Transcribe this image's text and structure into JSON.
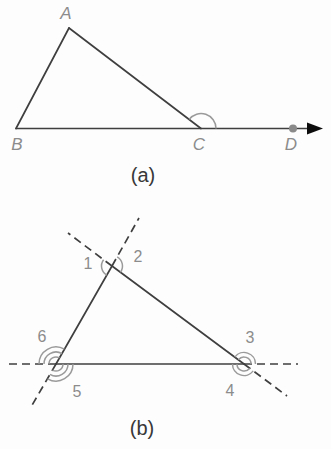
{
  "colors": {
    "background": "#fdfdfd",
    "line": "#3f3f3f",
    "arc": "#9a9a9a",
    "label": "#8c8c8c",
    "caption": "#383838",
    "point_dot": "#8a8a8a",
    "arrowhead": "#0d0d0d"
  },
  "figure_a": {
    "caption": "(a)",
    "vertex_labels": {
      "A": "A",
      "B": "B",
      "C": "C",
      "D": "D"
    }
  },
  "figure_b": {
    "caption": "(b)",
    "angle_labels": {
      "1": "1",
      "2": "2",
      "3": "3",
      "4": "4",
      "5": "5",
      "6": "6"
    }
  }
}
